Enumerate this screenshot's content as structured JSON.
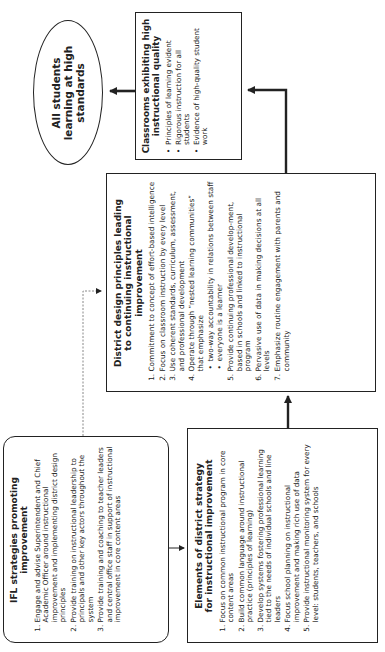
{
  "nodes": {
    "goal": {
      "title": "All students learning at high standards"
    },
    "classrooms": {
      "title": "Classrooms exhibiting high instructional quality",
      "bullets": [
        "Principles of learning evident",
        "Rigorous instruction for all students",
        "Evidence of high-quality student work"
      ]
    },
    "district": {
      "title": "District design principles leading to continuing instructional improvement",
      "items": [
        "Commitment to concept of effort-based intelligence",
        "Focus on classroom instruction by every level",
        "Use coherent standards, curriculum, assessment, and professional development",
        "Operate through “nested learning communities” that emphasize",
        "Provide continuing professional develop-ment, based in schools and linked to instructional program",
        "Pervasive use of data in making decisions at all levels",
        "Emphasize routine engagement with parents and community"
      ],
      "sub_bullets": [
        "two-way accountability in relations between staff",
        "everyone is a learner"
      ]
    },
    "ifl": {
      "title": "IFL strategies promoting improvement",
      "items": [
        "Engage and advise Superintendent and Chief Academic Officer around instructional improvement and implementing district design principles",
        "Provide training on instructional leadership to principals and other key actors throughout the system",
        "Provide training and coaching to teacher leaders and central office staff in support of instructional improvement in core content areas"
      ]
    },
    "elements": {
      "title": "Elements of district strategy for instructional improvement",
      "items": [
        "Focus on common instructional program in core content areas",
        "Build common language around instructional practice (principles of learning)",
        "Develop systems fostering professional learning tied to the needs of individual schools and line leaders",
        "Focus school planning on instructional improvement and making rich use of data",
        "Provide instructional monitoring system for every level: students, teachers, and schools"
      ]
    }
  },
  "edges": [
    {
      "from": "ifl",
      "to": "elements",
      "style": "solid"
    },
    {
      "from": "ifl",
      "to": "district",
      "style": "dotted"
    },
    {
      "from": "elements",
      "to": "district",
      "style": "solid-bold"
    },
    {
      "from": "district",
      "to": "classrooms",
      "style": "solid-bold"
    },
    {
      "from": "classrooms",
      "to": "goal",
      "style": "solid-bold"
    }
  ],
  "colors": {
    "line": "#222222",
    "dotted": "#888888",
    "background": "#ffffff"
  }
}
